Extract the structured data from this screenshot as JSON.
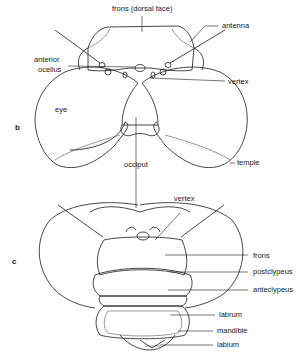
{
  "figure": {
    "panels": [
      {
        "id": "b",
        "label": "b",
        "labels": {
          "frons_dorsal": "frons (dorsal face)",
          "antenna": "antenna",
          "anterior_ocellus_1": "anterior",
          "anterior_ocellus_2": "ocellus",
          "vertex": "vertex",
          "eye": "eye",
          "occiput": "occiput",
          "temple": "temple"
        }
      },
      {
        "id": "c",
        "label": "c",
        "labels": {
          "vertex": "vertex",
          "frons": "frons",
          "postclypeus": "postclypeus",
          "anteclypeus": "anteclypeus",
          "labrum": "labrum",
          "mandible": "mandible",
          "labium": "labium"
        }
      }
    ]
  }
}
